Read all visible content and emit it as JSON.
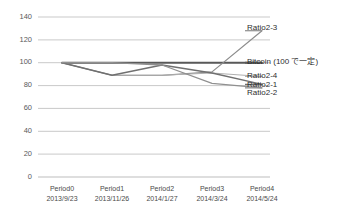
{
  "chart_data": {
    "type": "line",
    "title": "",
    "xlabel": "",
    "ylabel": "",
    "ylim": [
      0,
      140
    ],
    "ytick_step": 20,
    "grid": true,
    "legend_position": "right-inline-labels",
    "categories": [
      "Period0",
      "Period1",
      "Period2",
      "Period3",
      "Period4"
    ],
    "category_dates": [
      "2013/9/23",
      "2013/11/26",
      "2014/1/27",
      "2014/3/24",
      "2014/5/24"
    ],
    "yticks": [
      "0",
      "20",
      "40",
      "60",
      "80",
      "100",
      "120",
      "140"
    ],
    "series": [
      {
        "name": "Bitcoin (100 で一定)",
        "values": [
          100,
          100,
          100,
          100,
          100
        ],
        "color": "#595959",
        "width": 1.9
      },
      {
        "name": "Ratio2-3",
        "values": [
          100,
          89,
          89,
          92,
          128
        ],
        "color": "#8c8c8c",
        "width": 1.2
      },
      {
        "name": "Ratio2-4",
        "values": [
          100,
          89,
          89,
          91,
          88
        ],
        "color": "#b0b0b0",
        "width": 1.1
      },
      {
        "name": "Ratio2-1",
        "values": [
          100,
          89,
          98,
          91,
          81
        ],
        "color": "#707070",
        "width": 1.4
      },
      {
        "name": "Ratio2-2",
        "values": [
          100,
          100,
          98,
          82,
          78
        ],
        "color": "#909090",
        "width": 1.3
      }
    ],
    "annotations": [
      {
        "text": "Ratio2-3",
        "x": 247,
        "y": 28
      },
      {
        "text": "Bitcoin (100 で一定)",
        "x": 247,
        "y": 58
      },
      {
        "text": "Ratio2-4",
        "x": 247,
        "y": 72
      },
      {
        "text": "Ratio2-1",
        "x": 247,
        "y": 80
      },
      {
        "text": "Ratio2-2",
        "x": 247,
        "y": 88
      }
    ]
  },
  "colors": {
    "gridline": "#c9c9c9",
    "axis_text": "#4a4a4a",
    "background": "#ffffff"
  }
}
